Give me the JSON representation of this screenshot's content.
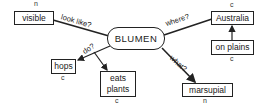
{
  "center": {
    "label": "BLUMEN"
  },
  "nodes": {
    "visible": {
      "label": "visible",
      "tag": "n"
    },
    "australia": {
      "label": "Australia",
      "tag": "c"
    },
    "on_plains": {
      "label": "on plains",
      "tag": "c"
    },
    "hops": {
      "label": "hops",
      "tag": "c"
    },
    "eats_plants": {
      "label": "eats plants",
      "tag": "c"
    },
    "marsupial": {
      "label": "marsupial",
      "tag": "n"
    }
  },
  "edges": {
    "look_like": "look like?",
    "where": "where?",
    "do": "do?",
    "what": "what?"
  },
  "colors": {
    "ink": "#222222",
    "background": "#ffffff"
  }
}
